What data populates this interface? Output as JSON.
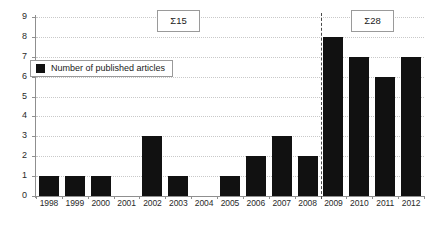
{
  "chart_data": {
    "type": "bar",
    "title": "",
    "xlabel": "",
    "ylabel": "",
    "ylim": [
      0,
      9
    ],
    "ytick_values": [
      0,
      1,
      2,
      3,
      4,
      5,
      6,
      7,
      8,
      9
    ],
    "grid": true,
    "legend_position": "upper-left-inside",
    "categories": [
      "1998",
      "1999",
      "2000",
      "2001",
      "2002",
      "2003",
      "2004",
      "2005",
      "2006",
      "2007",
      "2008",
      "2009",
      "2010",
      "2011",
      "2012"
    ],
    "values": [
      1,
      1,
      1,
      0,
      3,
      1,
      0,
      1,
      2,
      3,
      2,
      8,
      7,
      6,
      7
    ],
    "series": [
      {
        "name": "Number of published articles",
        "values": [
          1,
          1,
          1,
          0,
          3,
          1,
          0,
          1,
          2,
          3,
          2,
          8,
          7,
          6,
          7
        ],
        "color": "#111111"
      }
    ],
    "annotations": [
      {
        "text": "Α15",
        "label": "sum-left",
        "group_categories": [
          "1998",
          "2008"
        ],
        "value": 15
      },
      {
        "text": "Α28",
        "label": "sum-right",
        "group_categories": [
          "2009",
          "2012"
        ],
        "value": 28
      }
    ],
    "divider": {
      "type": "vertical-dashed",
      "between": [
        "2008",
        "2009"
      ]
    }
  },
  "legend": {
    "label": "Number of published articles",
    "swatch_color": "#111111"
  },
  "annotations": {
    "left_sum": "Σ15",
    "right_sum": "Σ28"
  },
  "colors": {
    "bar": "#111111",
    "grid": "#c9c9c9",
    "axis": "#8f8f8f",
    "divider": "#4a4a4a",
    "background": "#ffffff",
    "box_border": "#9a9a9a"
  }
}
